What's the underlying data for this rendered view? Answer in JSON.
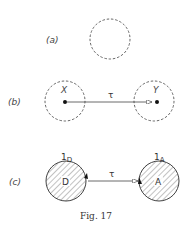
{
  "figure": {
    "caption": "Fig. 17",
    "panels": [
      {
        "label": "(a)",
        "elements": [
          {
            "type": "dashed-circle"
          }
        ]
      },
      {
        "label": "(b)",
        "nodes": [
          {
            "name": "X",
            "style": "dashed-circle",
            "label": "X"
          },
          {
            "name": "Y",
            "style": "dashed-circle",
            "label": "Y"
          }
        ],
        "edge": {
          "from": "X",
          "to": "Y",
          "label": "τ"
        }
      },
      {
        "label": "(c)",
        "nodes": [
          {
            "name": "D",
            "style": "hatched-circle",
            "label": "D",
            "superscript_label": "1",
            "subscript": "D"
          },
          {
            "name": "A",
            "style": "hatched-circle",
            "label": "A",
            "superscript_label": "1",
            "subscript": "A"
          }
        ],
        "edge": {
          "from": "D",
          "to": "A",
          "label": "τ"
        }
      }
    ]
  },
  "colors": {
    "stroke": "#555555",
    "text": "#333333",
    "background": "#ffffff"
  }
}
